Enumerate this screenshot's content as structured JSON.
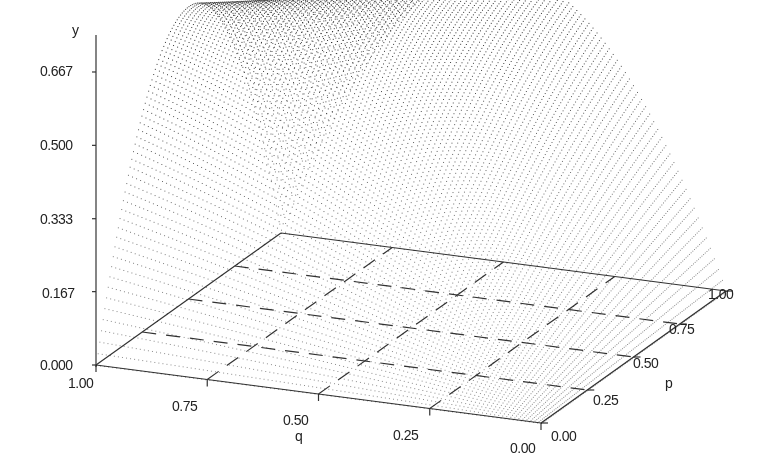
{
  "chart_data": {
    "type": "surface3d",
    "title": "",
    "axes": {
      "x": {
        "label": "q",
        "ticks": [
          "1.00",
          "0.75",
          "0.50",
          "0.25",
          "0.00"
        ],
        "range": [
          1.0,
          0.0
        ]
      },
      "z": {
        "label": "p",
        "ticks": [
          "0.00",
          "0.25",
          "0.50",
          "0.75",
          "1.00"
        ],
        "range": [
          0.0,
          1.0
        ]
      },
      "y": {
        "label": "y",
        "ticks": [
          "0.000",
          "0.167",
          "0.333",
          "0.500",
          "0.667"
        ],
        "range": [
          0.0,
          0.667
        ]
      }
    },
    "floor_grid": {
      "divisions": 4,
      "style": "dashed"
    },
    "surface": {
      "description": "Dome-shaped dotted surface over the (q,p) unit square, zero at the corners (q=1,p=0), (q=0,p=0) and (q=0,p=1), peaking near y=0.667",
      "peak_y": 0.667,
      "samples": [
        {
          "q": 1.0,
          "p": 0.0,
          "y": 0.0
        },
        {
          "q": 0.0,
          "p": 0.0,
          "y": 0.0
        },
        {
          "q": 0.0,
          "p": 1.0,
          "y": 0.0
        },
        {
          "q": 1.0,
          "p": 0.5,
          "y": 0.667
        },
        {
          "q": 0.5,
          "p": 1.0,
          "y": 0.667
        },
        {
          "q": 0.5,
          "p": 0.5,
          "y": 0.5
        }
      ]
    },
    "grid": false,
    "legend": null
  },
  "labels": {
    "y_axis": "y",
    "y_ticks": [
      "0.667",
      "0.500",
      "0.333",
      "0.167",
      "0.000"
    ],
    "q_axis": "q",
    "q_ticks": [
      "1.00",
      "0.75",
      "0.50",
      "0.25",
      "0.00"
    ],
    "p_axis": "p",
    "p_ticks": [
      "0.00",
      "0.25",
      "0.50",
      "0.75",
      "1.00"
    ]
  }
}
